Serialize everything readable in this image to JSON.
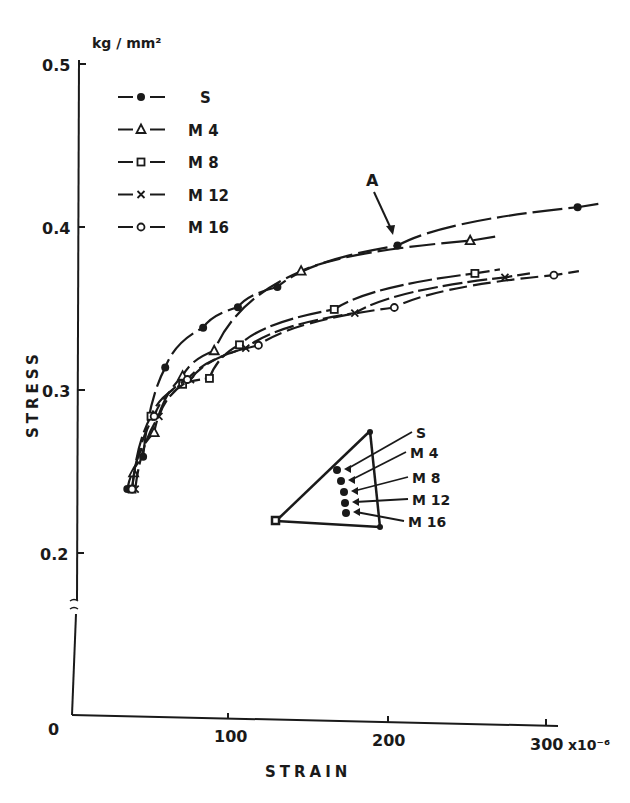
{
  "chart_data": {
    "type": "line",
    "title": "",
    "xlabel": "STRAIN",
    "ylabel": "STRESS",
    "y_unit": "kg / mm²",
    "x_multiplier_label": "x10⁻⁶",
    "xlim": [
      0,
      300
    ],
    "ylim": [
      0,
      0.5
    ],
    "y_axis_break_between": [
      0,
      0.2
    ],
    "x_ticks": [
      {
        "value": 0,
        "label": "0"
      },
      {
        "value": 100,
        "label": "100"
      },
      {
        "value": 200,
        "label": "200"
      },
      {
        "value": 300,
        "label": "300"
      }
    ],
    "y_ticks": [
      {
        "value": 0.2,
        "label": "0.2"
      },
      {
        "value": 0.3,
        "label": "0.3"
      },
      {
        "value": 0.4,
        "label": "0.4"
      },
      {
        "value": 0.5,
        "label": "0.5"
      }
    ],
    "grid": false,
    "legend_position": "upper-left",
    "annotation": {
      "text": "A",
      "points_to": {
        "series": "S",
        "x": 206,
        "y": 0.393
      }
    },
    "series": [
      {
        "name": "S",
        "marker": "filled-circle",
        "x": [
          35,
          45,
          59,
          83,
          105,
          130,
          206,
          320
        ],
        "y": [
          0.24,
          0.26,
          0.315,
          0.34,
          0.353,
          0.366,
          0.393,
          0.419
        ]
      },
      {
        "name": "M 4",
        "marker": "triangle",
        "x": [
          39,
          52,
          70,
          90,
          145,
          252
        ],
        "y": [
          0.25,
          0.275,
          0.31,
          0.326,
          0.376,
          0.397
        ]
      },
      {
        "name": "M 8",
        "marker": "square",
        "x": [
          38,
          50,
          70,
          87,
          106,
          166,
          255
        ],
        "y": [
          0.24,
          0.285,
          0.305,
          0.309,
          0.33,
          0.353,
          0.377
        ]
      },
      {
        "name": "M 12",
        "marker": "x",
        "x": [
          40,
          55,
          75,
          110,
          179,
          274
        ],
        "y": [
          0.24,
          0.285,
          0.308,
          0.328,
          0.351,
          0.375
        ]
      },
      {
        "name": "M 16",
        "marker": "open-circle",
        "x": [
          38,
          52,
          73,
          118,
          204,
          305
        ],
        "y": [
          0.24,
          0.285,
          0.308,
          0.33,
          0.355,
          0.377
        ]
      }
    ],
    "inset": {
      "description": "Triangular plate schematic showing gauge locations",
      "labels": [
        "S",
        "M 4",
        "M 8",
        "M 12",
        "M 16"
      ]
    }
  },
  "legend": {
    "items": [
      {
        "label": "S",
        "marker": "filled-circle"
      },
      {
        "label": "M 4",
        "marker": "triangle"
      },
      {
        "label": "M 8",
        "marker": "square"
      },
      {
        "label": "M 12",
        "marker": "x"
      },
      {
        "label": "M 16",
        "marker": "open-circle"
      }
    ]
  },
  "axes": {
    "y_unit": "kg / mm²",
    "y_title": "STRESS",
    "x_title": "STRAIN",
    "x_multiplier": "x10⁻⁶",
    "origin_label": "0",
    "tick_0_2": "0.2",
    "tick_0_3": "0.3",
    "tick_0_4": "0.4",
    "tick_0_5": "0.5",
    "x_100": "100",
    "x_200": "200",
    "x_300": "300"
  },
  "annotation_A": "A",
  "inset": {
    "labels": [
      "S",
      "M 4",
      "M 8",
      "M 12",
      "M 16"
    ]
  }
}
